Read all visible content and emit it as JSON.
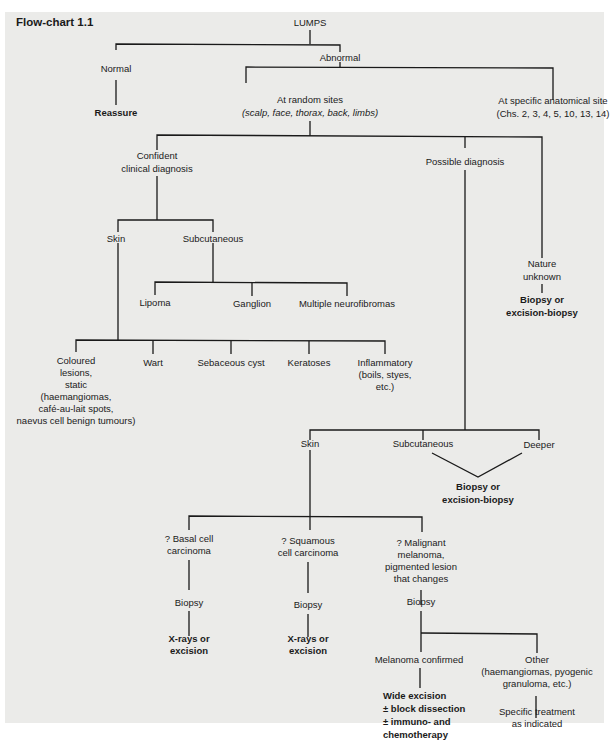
{
  "title": "Flow-chart 1.1",
  "nodes": {
    "root": "LUMPS",
    "normal": "Normal",
    "reassure": "Reassure",
    "abnormal": "Abnormal",
    "random_sites": "At random sites",
    "random_sites_detail": "(scalp, face, thorax, back, limbs)",
    "specific_site": "At specific anatomical site",
    "specific_site_detail": "(Chs. 2, 3, 4, 5, 10, 13, 14)",
    "confident_1": "Confident",
    "confident_2": "clinical diagnosis",
    "possible": "Possible diagnosis",
    "nature_1": "Nature",
    "nature_2": "unknown",
    "nature_action_1": "Biopsy or",
    "nature_action_2": "excision-biopsy",
    "skin": "Skin",
    "subcutaneous": "Subcutaneous",
    "lipoma": "Lipoma",
    "ganglion": "Ganglion",
    "neurofibromas": "Multiple neurofibromas",
    "coloured": [
      "Coloured",
      "lesions,",
      "static",
      "(haemangiomas,",
      "café-au-lait spots,",
      "naevus cell benign tumours)"
    ],
    "wart": "Wart",
    "sebaceous": "Sebaceous cyst",
    "keratoses": "Keratoses",
    "inflammatory": [
      "Inflammatory",
      "(boils, styes,",
      "etc.)"
    ],
    "pd_skin": "Skin",
    "pd_subcutaneous": "Subcutaneous",
    "pd_deeper": "Deeper",
    "pd_action_1": "Biopsy or",
    "pd_action_2": "excision-biopsy",
    "bcc": [
      "? Basal cell",
      "carcinoma"
    ],
    "scc": [
      "? Squamous",
      "cell carcinoma"
    ],
    "melanoma": [
      "? Malignant",
      "melanoma,",
      "pigmented lesion",
      "that changes"
    ],
    "bcc_biopsy": "Biopsy",
    "scc_biopsy": "Biopsy",
    "mel_biopsy": "Biopsy",
    "bcc_action": [
      "X-rays or",
      "excision"
    ],
    "scc_action": [
      "X-rays or",
      "excision"
    ],
    "mel_confirmed": "Melanoma confirmed",
    "mel_other": [
      "Other",
      "(haemangiomas, pyogenic",
      "granuloma, etc.)"
    ],
    "mel_treatment": [
      "Wide excision",
      "± block dissection",
      "± immuno- and",
      "chemotherapy"
    ],
    "other_treatment": [
      "Specific treatment",
      "as indicated"
    ]
  }
}
